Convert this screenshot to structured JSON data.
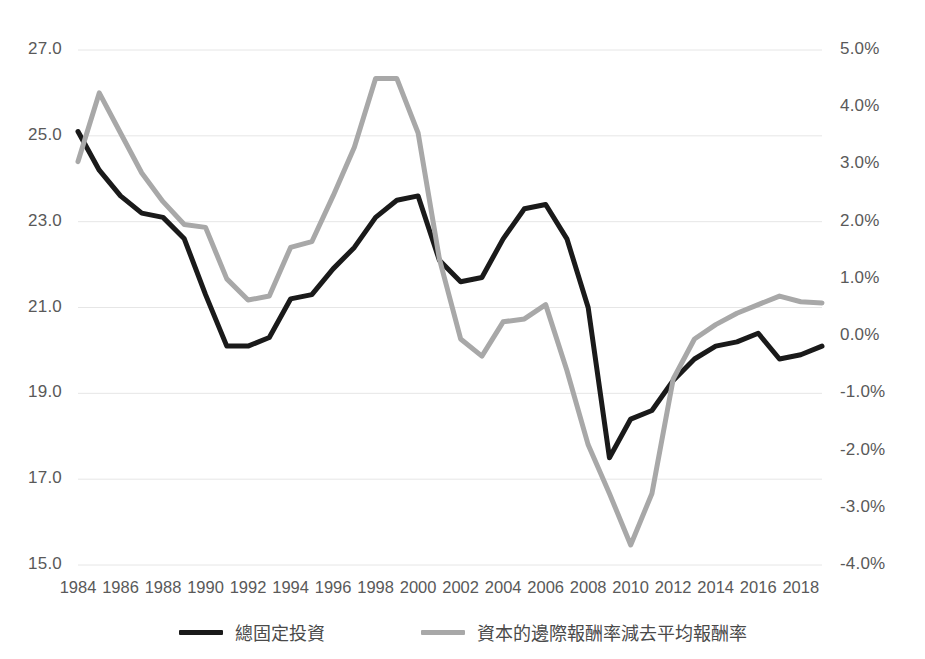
{
  "chart_data": {
    "type": "line",
    "title": "",
    "xlabel": "",
    "ylabel": "",
    "grid": true,
    "legend_position": "bottom",
    "x": [
      1984,
      1985,
      1986,
      1987,
      1988,
      1989,
      1990,
      1991,
      1992,
      1993,
      1994,
      1995,
      1996,
      1997,
      1998,
      1999,
      2000,
      2001,
      2002,
      2003,
      2004,
      2005,
      2006,
      2007,
      2008,
      2009,
      2010,
      2011,
      2012,
      2013,
      2014,
      2015,
      2016,
      2017,
      2018,
      2019
    ],
    "x_ticks": [
      "1984",
      "1986",
      "1988",
      "1990",
      "1992",
      "1994",
      "1996",
      "1998",
      "2000",
      "2002",
      "2004",
      "2006",
      "2008",
      "2010",
      "2012",
      "2014",
      "2016",
      "2018"
    ],
    "left_axis": {
      "ticks": [
        "15.0",
        "17.0",
        "19.0",
        "21.0",
        "23.0",
        "25.0",
        "27.0"
      ],
      "values": [
        15.0,
        17.0,
        19.0,
        21.0,
        23.0,
        25.0,
        27.0
      ],
      "ylim": [
        15.0,
        27.0
      ]
    },
    "right_axis": {
      "ticks": [
        "-4.0%",
        "-3.0%",
        "-2.0%",
        "-1.0%",
        "0.0%",
        "1.0%",
        "2.0%",
        "3.0%",
        "4.0%",
        "5.0%"
      ],
      "values": [
        -4.0,
        -3.0,
        -2.0,
        -1.0,
        0.0,
        1.0,
        2.0,
        3.0,
        4.0,
        5.0
      ],
      "ylim": [
        -4.0,
        5.0
      ]
    },
    "series": [
      {
        "name": "總固定投資",
        "axis": "left",
        "color": "#1a1a1a",
        "width": 5,
        "values": [
          25.1,
          24.2,
          23.6,
          23.2,
          23.1,
          22.6,
          21.3,
          20.1,
          20.1,
          20.3,
          21.2,
          21.3,
          21.9,
          22.4,
          23.1,
          23.5,
          23.6,
          22.1,
          21.6,
          21.7,
          22.6,
          23.3,
          23.4,
          22.6,
          21.0,
          17.5,
          18.4,
          18.6,
          19.3,
          19.8,
          20.1,
          20.2,
          20.4,
          19.8,
          19.9,
          20.1
        ]
      },
      {
        "name": "資本的邊際報酬率減去平均報酬率",
        "axis": "right",
        "color": "#a8a8a8",
        "width": 5,
        "values": [
          3.05,
          4.25,
          3.55,
          2.85,
          2.35,
          1.95,
          1.9,
          1.0,
          0.63,
          0.7,
          1.55,
          1.65,
          2.45,
          3.3,
          4.5,
          4.5,
          3.55,
          1.35,
          -0.05,
          -0.35,
          0.25,
          0.3,
          0.55,
          -0.6,
          -1.9,
          -2.75,
          -3.65,
          -2.75,
          -0.75,
          -0.05,
          0.2,
          0.4,
          0.55,
          0.7,
          0.6,
          0.58
        ]
      }
    ]
  },
  "legend": {
    "items": [
      {
        "label": "總固定投資",
        "color": "#1a1a1a",
        "swatch_name": "legend-swatch-black"
      },
      {
        "label": "資本的邊際報酬率減去平均報酬率",
        "color": "#a8a8a8",
        "swatch_name": "legend-swatch-gray"
      }
    ]
  }
}
